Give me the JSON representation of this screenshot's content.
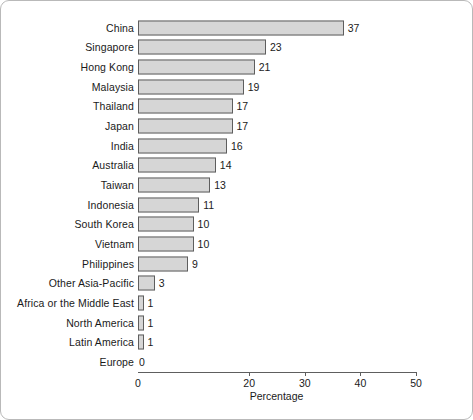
{
  "chart_data": {
    "type": "bar",
    "orientation": "horizontal",
    "title": "",
    "xlabel": "Percentage",
    "ylabel": "",
    "xlim": [
      0,
      50
    ],
    "xticks": [
      0,
      20,
      30,
      40,
      50
    ],
    "xtick_labels": [
      "0",
      "20",
      "30",
      "40",
      "50"
    ],
    "grid": false,
    "legend": null,
    "bar_fill_color": "#d6d6d6",
    "bar_edge_color": "#5e5e5e",
    "categories": [
      "China",
      "Singapore",
      "Hong Kong",
      "Malaysia",
      "Thailand",
      "Japan",
      "India",
      "Australia",
      "Taiwan",
      "Indonesia",
      "South Korea",
      "Vietnam",
      "Philippines",
      "Other Asia-Pacific",
      "Africa or the Middle East",
      "North America",
      "Latin America",
      "Europe"
    ],
    "values": [
      37,
      23,
      21,
      19,
      17,
      17,
      16,
      14,
      13,
      11,
      10,
      10,
      9,
      3,
      1,
      1,
      1,
      0
    ],
    "data_labels": [
      "37",
      "23",
      "21",
      "19",
      "17",
      "17",
      "16",
      "14",
      "13",
      "11",
      "10",
      "10",
      "9",
      "3",
      "1",
      "1",
      "1",
      "0"
    ]
  }
}
